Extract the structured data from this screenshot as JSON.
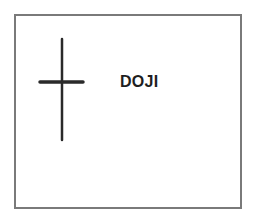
{
  "diagram": {
    "title": "DOJI",
    "pattern": "doji-candlestick",
    "colors": {
      "line": "#2a2a2a",
      "border": "#7a7a7a",
      "text": "#1e1e1e",
      "background": "#ffffff"
    }
  }
}
